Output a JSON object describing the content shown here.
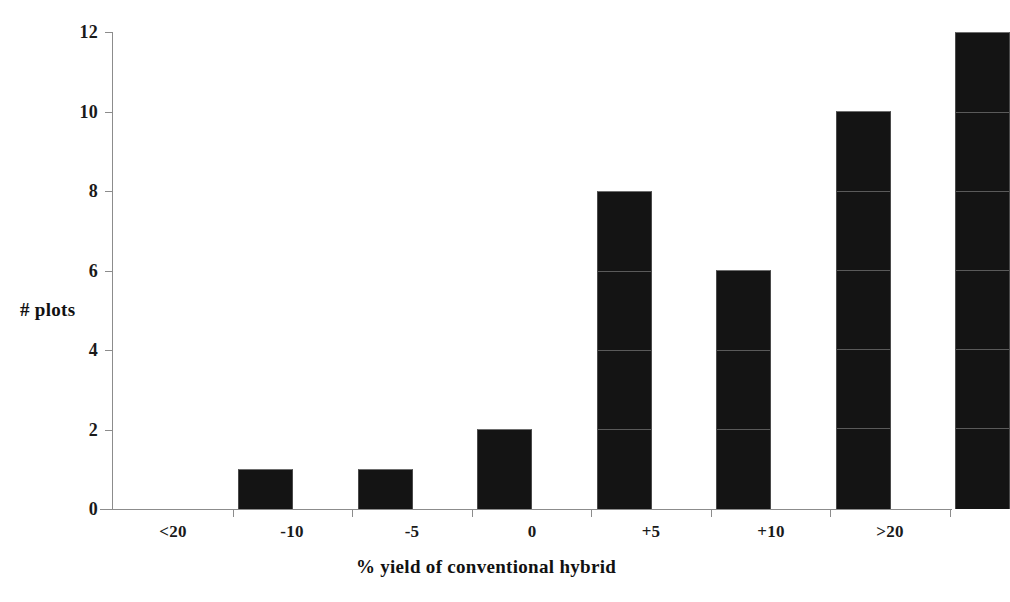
{
  "chart_data": {
    "type": "bar",
    "title": "",
    "xlabel": "% yield of conventional hybrid",
    "ylabel": "# plots",
    "categories": [
      "<20",
      "-10",
      "-5",
      "0",
      "+5",
      "+10",
      ">20"
    ],
    "values": [
      1,
      1,
      2,
      8,
      6,
      10,
      12
    ],
    "series": [
      {
        "name": "# plots",
        "values": [
          1,
          1,
          2,
          8,
          6,
          10,
          12
        ]
      }
    ],
    "ylim": [
      0,
      12
    ],
    "y_ticks": [
      0,
      2,
      4,
      6,
      8,
      10,
      12
    ],
    "y_tick_labels": [
      "0",
      "2",
      "4",
      "6",
      "8",
      "10",
      "12"
    ],
    "grid": false,
    "legend": false,
    "legend_position": "none",
    "bar_color": "#141414",
    "axis_color": "#8c8c8c",
    "background_color": "#ffffff"
  },
  "axis_titles": {
    "y": "# plots",
    "x": "% yield of conventional hybrid"
  }
}
